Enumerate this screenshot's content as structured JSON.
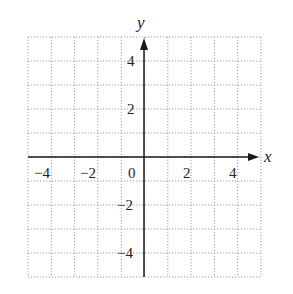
{
  "chart_data": {
    "type": "scatter",
    "title": "",
    "xlabel": "x",
    "ylabel": "y",
    "xlim": [
      -5,
      5
    ],
    "ylim": [
      -5,
      5
    ],
    "grid": true,
    "grid_style": "dotted",
    "x_ticks": [
      -4,
      -2,
      0,
      2,
      4
    ],
    "y_ticks": [
      4,
      2,
      -2,
      -4
    ],
    "series": []
  },
  "labels": {
    "x_axis": "x",
    "y_axis": "y",
    "x_tick_labels": [
      "−4",
      "−2",
      "0",
      "2",
      "4"
    ],
    "y_tick_labels": [
      "4",
      "2",
      "−2",
      "−4"
    ]
  },
  "colors": {
    "grid": "#9a9a9a",
    "axis": "#1a1a1a",
    "background": "#ffffff"
  }
}
